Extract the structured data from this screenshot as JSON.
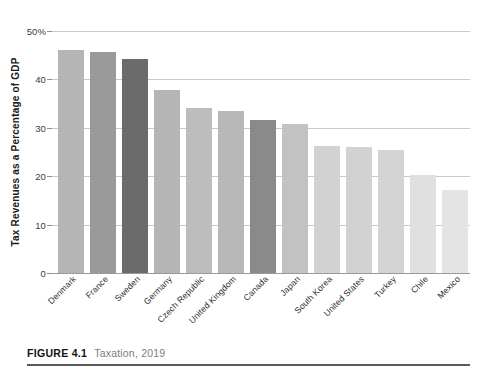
{
  "figure": {
    "number_label": "FIGURE 4.1",
    "title": "Taxation, 2019"
  },
  "axis": {
    "y_title": "Tax Revenues as a Percentage of GDP",
    "y_ticks": [
      "50%",
      "40",
      "30",
      "20",
      "10",
      "0"
    ],
    "y_tick_values": [
      50,
      40,
      30,
      20,
      10,
      0
    ]
  },
  "colors": {
    "bar_light": "#d9d9d9",
    "bar_lighter": "#e2e2e2",
    "bar_mid": "#b5b5b5",
    "bar_mid_dark": "#a0a0a0",
    "bar_dark": "#9a9a9a",
    "bar_darkest": "#6b6b6b",
    "bar_accent_dark": "#8a8a8a",
    "gridline": "#c8c8c8",
    "baseline": "#9a9a9a",
    "caption_number": "#111111",
    "caption_title": "#7d7d7d",
    "rule": "#5b5b5b"
  },
  "chart_data": {
    "type": "bar",
    "title": "Taxation, 2019",
    "xlabel": "",
    "ylabel": "Tax Revenues as a Percentage of GDP",
    "ylim": [
      0,
      50
    ],
    "yticks": [
      0,
      10,
      20,
      30,
      40,
      50
    ],
    "grid": true,
    "legend": "none",
    "categories": [
      "Denmark",
      "France",
      "Sweden",
      "Germany",
      "Czech Republic",
      "United Kingdom",
      "Canada",
      "Japan",
      "South Korea",
      "United States",
      "Turkey",
      "Chile",
      "Mexico"
    ],
    "values": [
      46.1,
      45.7,
      44.3,
      37.8,
      34.1,
      33.5,
      31.7,
      30.7,
      26.2,
      26.0,
      25.5,
      20.2,
      17.2
    ],
    "bar_colors": [
      "#b5b5b5",
      "#9a9a9a",
      "#6b6b6b",
      "#b5b5b5",
      "#bdbdbd",
      "#b8b8b8",
      "#8a8a8a",
      "#c2c2c2",
      "#d2d2d2",
      "#d2d2d2",
      "#d4d4d4",
      "#e0e0e0",
      "#e4e4e4"
    ]
  }
}
